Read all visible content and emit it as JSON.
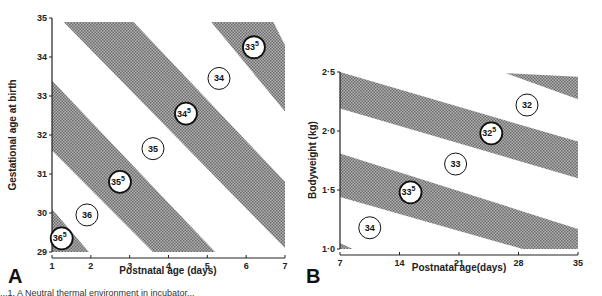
{
  "chart_data": [
    {
      "panel": "A",
      "type": "area",
      "title": "",
      "xlabel": "Postnatal age (days)",
      "ylabel": "Gestational age at birth",
      "xlim": [
        1,
        7
      ],
      "ylim": [
        29,
        35
      ],
      "xticks": [
        "1",
        "2",
        "3",
        "4",
        "5",
        "6",
        "7"
      ],
      "yticks": [
        "29",
        "30",
        "31",
        "32",
        "33",
        "34",
        "35"
      ],
      "grid": false,
      "bands_shaded": [
        {
          "label": "36.5",
          "polygon": [
            [
              1,
              29
            ],
            [
              1,
              30.1
            ],
            [
              1.95,
              29
            ]
          ]
        },
        {
          "label": "35.5",
          "polygon": [
            [
              1,
              33.4
            ],
            [
              1,
              31.6
            ],
            [
              3.6,
              29
            ],
            [
              5.2,
              29
            ]
          ]
        },
        {
          "label": "34.5",
          "polygon": [
            [
              1.3,
              34.9
            ],
            [
              3.1,
              34.9
            ],
            [
              7,
              30.8
            ],
            [
              7,
              29.1
            ]
          ]
        },
        {
          "label": "33.5",
          "polygon": [
            [
              5.1,
              34.9
            ],
            [
              6.7,
              34.9
            ],
            [
              7,
              34.3
            ],
            [
              7,
              32.6
            ]
          ]
        }
      ],
      "labels": [
        {
          "text": "36",
          "sup": "5",
          "x": 1.25,
          "y": 29.35,
          "shaded": true
        },
        {
          "text": "36",
          "sup": "",
          "x": 1.9,
          "y": 29.95,
          "shaded": false
        },
        {
          "text": "35",
          "sup": "5",
          "x": 2.75,
          "y": 30.8,
          "shaded": true
        },
        {
          "text": "35",
          "sup": "",
          "x": 3.6,
          "y": 31.65,
          "shaded": false
        },
        {
          "text": "34",
          "sup": "5",
          "x": 4.45,
          "y": 32.55,
          "shaded": true
        },
        {
          "text": "34",
          "sup": "",
          "x": 5.3,
          "y": 33.45,
          "shaded": false
        },
        {
          "text": "33",
          "sup": "5",
          "x": 6.2,
          "y": 34.25,
          "shaded": true
        }
      ]
    },
    {
      "panel": "B",
      "type": "area",
      "title": "",
      "xlabel": "Postnatal age(days)",
      "ylabel": "Bodyweight (kg)",
      "xlim": [
        7,
        35
      ],
      "ylim": [
        1.0,
        2.5
      ],
      "xticks": [
        "7",
        "14",
        "21",
        "28",
        "35"
      ],
      "yticks": [
        "1·0",
        "1·5",
        "2·0",
        "2·5"
      ],
      "grid": false,
      "bands_shaded": [
        {
          "label": "33.5",
          "polygon": [
            [
              7,
              1.81
            ],
            [
              7,
              1.44
            ],
            [
              28.5,
              1.0
            ],
            [
              35,
              1.0
            ],
            [
              35,
              1.17
            ]
          ]
        },
        {
          "label": "32.5",
          "polygon": [
            [
              7,
              2.5
            ],
            [
              7,
              2.19
            ],
            [
              35,
              1.6
            ],
            [
              35,
              1.91
            ]
          ]
        },
        {
          "label": "32",
          "polygon": [
            [
              26.5,
              2.49
            ],
            [
              35,
              2.46
            ],
            [
              35,
              2.27
            ]
          ]
        },
        {
          "label": "34",
          "polygon": [
            [
              7,
              1.0
            ],
            [
              8.5,
              1.0
            ],
            [
              7,
              1.05
            ]
          ]
        }
      ],
      "labels": [
        {
          "text": "34",
          "sup": "",
          "x": 10.5,
          "y": 1.18,
          "shaded": false
        },
        {
          "text": "33",
          "sup": "5",
          "x": 15.3,
          "y": 1.48,
          "shaded": true
        },
        {
          "text": "33",
          "sup": "",
          "x": 20.6,
          "y": 1.72,
          "shaded": false
        },
        {
          "text": "32",
          "sup": "5",
          "x": 24.8,
          "y": 1.98,
          "shaded": true
        },
        {
          "text": "32",
          "sup": "",
          "x": 29.0,
          "y": 2.22,
          "shaded": false
        }
      ]
    }
  ],
  "panel_labels": {
    "a": "A",
    "b": "B"
  },
  "caption": "...1. A  Neutral thermal environment in incubator..."
}
